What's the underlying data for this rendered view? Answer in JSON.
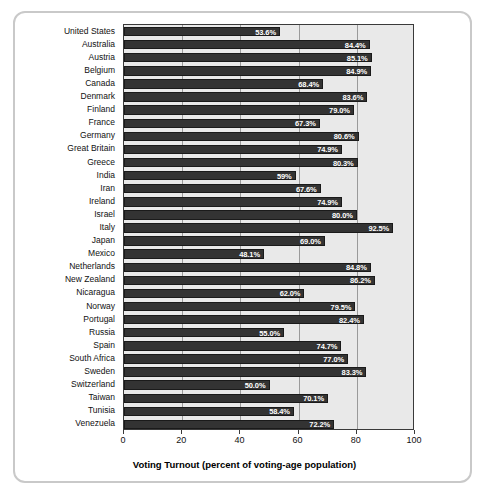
{
  "chart_data": {
    "type": "bar",
    "orientation": "horizontal",
    "title": "",
    "xlabel": "Voting Turnout (percent of voting-age population)",
    "ylabel": "",
    "xlim": [
      0,
      100
    ],
    "xticks": [
      0,
      20,
      40,
      60,
      80,
      100
    ],
    "xtick_labels": [
      "0",
      "20",
      "40",
      "60",
      "80",
      "100"
    ],
    "grid": true,
    "legend": "none",
    "bar_color": "#333333",
    "plot_background": "#e9e9e9",
    "value_label_color": "#ffffff",
    "categories": [
      "United States",
      "Australia",
      "Austria",
      "Belgium",
      "Canada",
      "Denmark",
      "Finland",
      "France",
      "Germany",
      "Great Britain",
      "Greece",
      "India",
      "Iran",
      "Ireland",
      "Israel",
      "Italy",
      "Japan",
      "Mexico",
      "Netherlands",
      "New Zealand",
      "Nicaragua",
      "Norway",
      "Portugal",
      "Russia",
      "Spain",
      "South Africa",
      "Sweden",
      "Switzerland",
      "Taiwan",
      "Tunisia",
      "Venezuela"
    ],
    "values": [
      53.6,
      84.4,
      85.1,
      84.9,
      68.4,
      83.6,
      79.0,
      67.3,
      80.6,
      74.9,
      80.3,
      59.0,
      67.6,
      74.9,
      80.0,
      92.5,
      69.0,
      48.1,
      84.8,
      86.2,
      62.0,
      79.5,
      82.4,
      55.0,
      74.7,
      77.0,
      83.3,
      50.0,
      70.1,
      58.4,
      72.2
    ],
    "value_labels": [
      "53.6%",
      "84.4%",
      "85.1%",
      "84.9%",
      "68.4%",
      "83.6%",
      "79.0%",
      "67.3%",
      "80.6%",
      "74.9%",
      "80.3%",
      "59%",
      "67.6%",
      "74.9%",
      "80.0%",
      "92.5%",
      "69.0%",
      "48.1%",
      "84.8%",
      "86.2%",
      "62.0%",
      "79.5%",
      "82.4%",
      "55.0%",
      "74.7%",
      "77.0%",
      "83.3%",
      "50.0%",
      "70.1%",
      "58.4%",
      "72.2%"
    ]
  }
}
